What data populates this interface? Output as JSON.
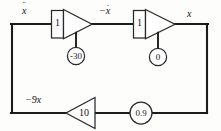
{
  "diagram": {
    "type": "analog-computer-block-diagram",
    "title": "",
    "background_color": "#fdfdfb",
    "line_color": "#1c1c1c",
    "signals": [
      {
        "id": "xddot",
        "base": "x",
        "dots": "¨",
        "text": "ẍ",
        "position": "top-left"
      },
      {
        "id": "minus-xdot",
        "base": "x",
        "dots": "·",
        "prefix": "−",
        "text": "−ẋ",
        "position": "top-middle"
      },
      {
        "id": "x",
        "base": "x",
        "dots": "",
        "text": "x",
        "position": "top-right"
      },
      {
        "id": "minus-9x",
        "base": "9x",
        "dots": "",
        "prefix": "−",
        "text": "−9x",
        "position": "bottom-left"
      }
    ],
    "blocks": [
      {
        "id": "integrator-1",
        "kind": "integrator",
        "input_gain": "1",
        "initial_condition": "-30",
        "input_signal": "ẍ",
        "output_signal": "−ẋ"
      },
      {
        "id": "integrator-2",
        "kind": "integrator",
        "input_gain": "1",
        "initial_condition": "0",
        "input_signal": "−ẋ",
        "output_signal": "x"
      },
      {
        "id": "amplifier-1",
        "kind": "amplifier",
        "gain": "10",
        "direction": "right-to-left"
      },
      {
        "id": "potentiometer-1",
        "kind": "potentiometer",
        "coefficient": "0.9"
      }
    ]
  }
}
